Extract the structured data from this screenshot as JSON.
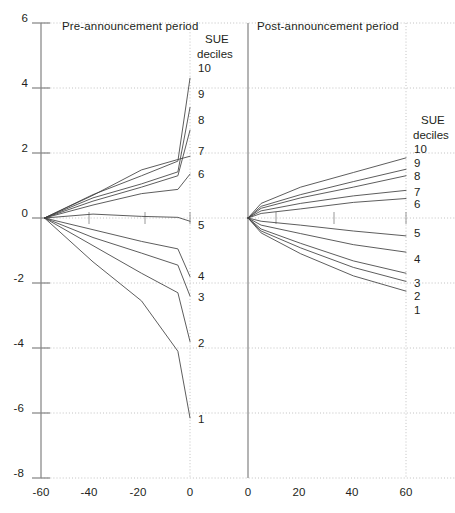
{
  "figure": {
    "background_color": "#ffffff",
    "line_color": "#404040",
    "axis_color": "#8c8c8c",
    "grid_color": "#b3b3b3",
    "text_color": "#231f20"
  },
  "panels": {
    "left": {
      "title": "Pre-announcement period",
      "legend_title_line1": "SUE",
      "legend_title_line2": "deciles"
    },
    "right": {
      "title": "Post-announcement period",
      "legend_title_line1": "SUE",
      "legend_title_line2": "deciles"
    }
  },
  "axes": {
    "y_ticks": [
      "6",
      "4",
      "2",
      "0",
      "-2",
      "-4",
      "-6",
      "-8"
    ],
    "x_ticks_left": [
      "-60",
      "-40",
      "-20",
      "0"
    ],
    "x_ticks_right": [
      "0",
      "20",
      "40",
      "60"
    ]
  },
  "chart_data": {
    "type": "line",
    "title": "",
    "subtitle": "",
    "xlabel": "",
    "ylabel": "",
    "ylim": [
      -8,
      6
    ],
    "grid": true,
    "legend_position": "right-of-panel",
    "panels": [
      {
        "name": "Pre-announcement period",
        "xlim": [
          -60,
          0
        ],
        "x": [
          -60,
          -40,
          -20,
          -5,
          0
        ],
        "series": [
          {
            "name": "10",
            "values": [
              0,
              0.72,
              1.3,
              1.75,
              4.3
            ]
          },
          {
            "name": "9",
            "values": [
              0,
              0.62,
              1.05,
              1.42,
              3.4
            ]
          },
          {
            "name": "8",
            "values": [
              0,
              0.52,
              0.95,
              1.3,
              2.7
            ]
          },
          {
            "name": "7",
            "values": [
              0,
              0.7,
              1.48,
              1.8,
              1.9
            ]
          },
          {
            "name": "6",
            "values": [
              0,
              0.4,
              0.75,
              0.88,
              1.35
            ]
          },
          {
            "name": "5",
            "values": [
              0,
              0.12,
              0.05,
              0.02,
              -0.1
            ]
          },
          {
            "name": "4",
            "values": [
              0,
              -0.36,
              -0.72,
              -0.95,
              -1.8
            ]
          },
          {
            "name": "3",
            "values": [
              0,
              -0.6,
              -1.08,
              -1.45,
              -2.4
            ]
          },
          {
            "name": "2",
            "values": [
              0,
              -0.85,
              -1.7,
              -2.3,
              -3.8
            ]
          },
          {
            "name": "1",
            "values": [
              0,
              -1.35,
              -2.55,
              -4.1,
              -6.15
            ]
          }
        ]
      },
      {
        "name": "Post-announcement period",
        "xlim": [
          0,
          60
        ],
        "x": [
          0,
          5,
          20,
          40,
          60
        ],
        "series": [
          {
            "name": "10",
            "values": [
              0,
              0.45,
              0.95,
              1.4,
              1.85
            ]
          },
          {
            "name": "9",
            "values": [
              0,
              0.36,
              0.72,
              1.12,
              1.5
            ]
          },
          {
            "name": "8",
            "values": [
              0,
              0.3,
              0.62,
              0.95,
              1.3
            ]
          },
          {
            "name": "7",
            "values": [
              0,
              0.22,
              0.45,
              0.68,
              0.85
            ]
          },
          {
            "name": "6",
            "values": [
              0,
              0.14,
              0.28,
              0.48,
              0.6
            ]
          },
          {
            "name": "5",
            "values": [
              0,
              -0.1,
              -0.22,
              -0.4,
              -0.55
            ]
          },
          {
            "name": "4",
            "values": [
              0,
              -0.22,
              -0.48,
              -0.82,
              -1.05
            ]
          },
          {
            "name": "3",
            "values": [
              0,
              -0.34,
              -0.78,
              -1.32,
              -1.7
            ]
          },
          {
            "name": "2",
            "values": [
              0,
              -0.4,
              -0.92,
              -1.52,
              -1.95
            ]
          },
          {
            "name": "1",
            "values": [
              0,
              -0.46,
              -1.1,
              -1.78,
              -2.25
            ]
          }
        ]
      }
    ]
  }
}
